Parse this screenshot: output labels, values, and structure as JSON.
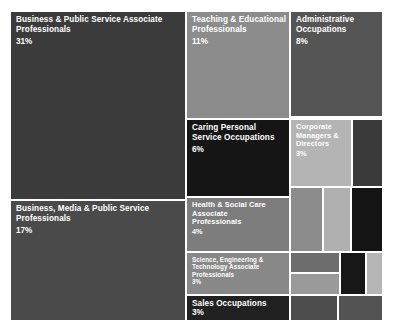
{
  "chart_data": {
    "type": "treemap",
    "title": "",
    "xlabel": "",
    "ylabel": "",
    "legend": "none",
    "grid": false,
    "categories": [
      "Business & Public Service Associate Professionals",
      "Business, Media & Public Service Professionals",
      "Teaching & Educational Professionals",
      "Administrative Occupations",
      "Caring Personal Service Occupations",
      "Health & Social Care Associate Professionals",
      "Corporate Managers & Directors",
      "Science, Engineering & Technology Associate Professionals",
      "Sales Occupations"
    ],
    "values": [
      31,
      17,
      11,
      8,
      6,
      4,
      3,
      3,
      3
    ],
    "value_suffix": "%"
  },
  "tiles": [
    {
      "id": "business-public-service-associate-professionals",
      "label": "Business & Public Service Associate\nProfessionals",
      "value": "31%",
      "color": "#3b3b3b",
      "text_color": "#ffffff",
      "x": 0,
      "y": 0,
      "w": 174,
      "h": 187,
      "size": "lg",
      "value_top": 25
    },
    {
      "id": "business-media-public-service-professionals",
      "label": "Business, Media & Public Service\nProfessionals",
      "value": "17%",
      "color": "#4a4a4a",
      "text_color": "#ffffff",
      "x": 0,
      "y": 189,
      "w": 174,
      "h": 119,
      "size": "lg",
      "value_top": 25
    },
    {
      "id": "teaching-educational-professionals",
      "label": "Teaching & Educational\nProfessionals",
      "value": "11%",
      "color": "#8c8c8c",
      "text_color": "#ffffff",
      "x": 176,
      "y": 0,
      "w": 102,
      "h": 106,
      "size": "lg",
      "value_top": 25
    },
    {
      "id": "administrative-occupations",
      "label": "Administrative\nOccupations",
      "value": "8%",
      "color": "#555555",
      "text_color": "#ffffff",
      "x": 280,
      "y": 0,
      "w": 91,
      "h": 104,
      "size": "lg",
      "value_top": 25
    },
    {
      "id": "caring-personal-service-occupations",
      "label": "Caring Personal\nService Occupations",
      "value": "6%",
      "color": "#151515",
      "text_color": "#ffffff",
      "x": 176,
      "y": 108,
      "w": 102,
      "h": 76,
      "size": "lg",
      "value_top": 25
    },
    {
      "id": "health-social-care-associate-professionals",
      "label": "Health & Social Care\nAssociate\nProfessionals",
      "value": "4%",
      "color": "#7d7d7d",
      "text_color": "#ffffff",
      "x": 176,
      "y": 186,
      "w": 102,
      "h": 53,
      "size": "md",
      "value_top": 30
    },
    {
      "id": "corporate-managers-directors",
      "label": "Corporate\nManagers &\nDirectors",
      "value": "3%",
      "color": "#b4b4b4",
      "text_color": "#ffffff",
      "x": 280,
      "y": 108,
      "w": 60,
      "h": 66,
      "size": "md",
      "value_top": 30
    },
    {
      "id": "science-engineering-technology-associate-professionals",
      "label": "Science, Engineering &\nTechnology Associate\nProfessionals",
      "value": "3%",
      "color": "#888888",
      "text_color": "#ffffff",
      "x": 176,
      "y": 241,
      "w": 102,
      "h": 41,
      "size": "sm",
      "value_top": 25
    },
    {
      "id": "sales-occupations",
      "label": "Sales Occupations",
      "value": "3%",
      "color": "#212121",
      "text_color": "#ffffff",
      "x": 176,
      "y": 284,
      "w": 102,
      "h": 24,
      "size": "lg",
      "value_top": 12
    }
  ],
  "filler_tiles": [
    {
      "id": "filler-1",
      "color": "#3a3a3a",
      "x": 342,
      "y": 108,
      "w": 29,
      "h": 66
    },
    {
      "id": "filler-2",
      "color": "#8c8c8c",
      "x": 280,
      "y": 176,
      "w": 31,
      "h": 63
    },
    {
      "id": "filler-3",
      "color": "#b0b0b0",
      "x": 313,
      "y": 176,
      "w": 26,
      "h": 63
    },
    {
      "id": "filler-4",
      "color": "#141414",
      "x": 341,
      "y": 176,
      "w": 30,
      "h": 63
    },
    {
      "id": "filler-5",
      "color": "#6d6d6d",
      "x": 280,
      "y": 241,
      "w": 48,
      "h": 19
    },
    {
      "id": "filler-6",
      "color": "#9a9a9a",
      "x": 280,
      "y": 262,
      "w": 48,
      "h": 20
    },
    {
      "id": "filler-7",
      "color": "#171717",
      "x": 330,
      "y": 241,
      "w": 24,
      "h": 41
    },
    {
      "id": "filler-8",
      "color": "#b5b5b5",
      "x": 356,
      "y": 241,
      "w": 15,
      "h": 41
    },
    {
      "id": "filler-9",
      "color": "#4d4d4d",
      "x": 280,
      "y": 284,
      "w": 46,
      "h": 24
    },
    {
      "id": "filler-10",
      "color": "#535353",
      "x": 328,
      "y": 284,
      "w": 43,
      "h": 24
    }
  ]
}
